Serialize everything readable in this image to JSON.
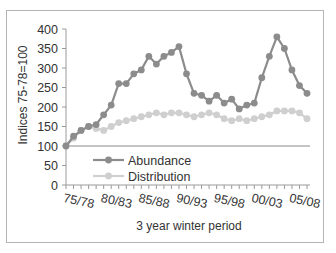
{
  "chart_data": {
    "type": "line",
    "title": "",
    "xlabel": "3 year winter period",
    "ylabel": "Indices 75-78=100",
    "ylim": [
      0,
      400
    ],
    "yticks": [
      0,
      50,
      100,
      150,
      200,
      250,
      300,
      350,
      400
    ],
    "x_tick_labels": [
      "75/78",
      "80/83",
      "85/88",
      "90/93",
      "95/98",
      "00/03",
      "05/08"
    ],
    "x": [
      "75/78",
      "76/79",
      "77/80",
      "78/81",
      "79/82",
      "80/83",
      "81/84",
      "82/85",
      "83/86",
      "84/87",
      "85/88",
      "86/89",
      "87/90",
      "88/91",
      "89/92",
      "90/93",
      "91/94",
      "92/95",
      "93/96",
      "94/97",
      "95/98",
      "96/99",
      "97/00",
      "98/01",
      "99/02",
      "00/03",
      "01/04",
      "02/05",
      "03/06",
      "04/07",
      "05/08",
      "06/09",
      "07/10"
    ],
    "grid": false,
    "reference_line": 100,
    "legend_position": "inside-lower-center",
    "series": [
      {
        "name": "Abundance",
        "color": "#8c8c8c",
        "values": [
          100,
          125,
          140,
          150,
          155,
          180,
          205,
          260,
          260,
          285,
          295,
          330,
          310,
          330,
          340,
          355,
          285,
          235,
          230,
          215,
          230,
          210,
          220,
          195,
          205,
          210,
          275,
          330,
          380,
          350,
          295,
          255,
          235
        ]
      },
      {
        "name": "Distribution",
        "color": "#cfcfcf",
        "values": [
          100,
          120,
          140,
          150,
          145,
          140,
          150,
          160,
          165,
          170,
          175,
          180,
          185,
          180,
          185,
          185,
          180,
          175,
          180,
          185,
          180,
          170,
          165,
          170,
          165,
          170,
          175,
          180,
          190,
          190,
          190,
          185,
          170
        ]
      }
    ]
  }
}
